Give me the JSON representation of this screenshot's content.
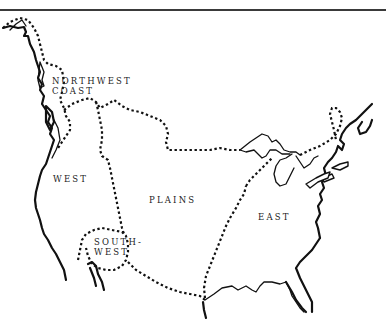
{
  "map": {
    "type": "cultural-regions",
    "regions": [
      {
        "id": "northwest-coast",
        "line1": "NORTHWEST",
        "line2": "COAST"
      },
      {
        "id": "west",
        "label": "WEST"
      },
      {
        "id": "plains",
        "label": "PLAINS"
      },
      {
        "id": "southwest",
        "line1": "SOUTH-",
        "line2": "WEST"
      },
      {
        "id": "east",
        "label": "EAST"
      }
    ],
    "colors": {
      "line": "#111111",
      "background": "#ffffff",
      "rule": "#3a3a3a"
    }
  }
}
